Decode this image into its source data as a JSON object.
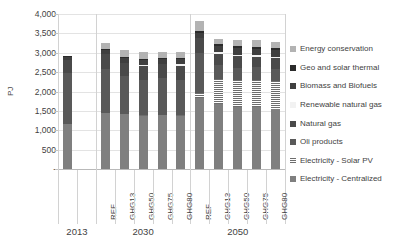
{
  "chart_data": {
    "type": "bar",
    "subtype": "stacked",
    "title": "",
    "xlabel": "",
    "ylabel": "PJ",
    "ylim": [
      0,
      4000
    ],
    "ytick_step": 500,
    "grid": true,
    "legend_position": "right",
    "ytick_labels": [
      "-",
      "500",
      "1,000",
      "1,500",
      "2,000",
      "2,500",
      "3,000",
      "3,500",
      "4,000"
    ],
    "ytick_values": [
      0,
      500,
      1000,
      1500,
      2000,
      2500,
      3000,
      3500,
      4000
    ],
    "groups": [
      {
        "label": "2013",
        "categories": [
          "",
          ""
        ]
      },
      {
        "label": "2030",
        "categories": [
          "REF",
          "GHG13",
          "GHG50",
          "GHG75",
          "GHG80"
        ]
      },
      {
        "label": "2050",
        "categories": [
          "REF",
          "GHG13",
          "GHG50",
          "GHG75",
          "GHG80"
        ]
      }
    ],
    "x": [
      "2013",
      "",
      "2030 REF",
      "2030 GHG13",
      "2030 GHG50",
      "2030 GHG75",
      "2030 GHG80",
      "2050 REF",
      "2050 GHG13",
      "2050 GHG50",
      "2050 GHG75",
      "2050 GHG80"
    ],
    "series": [
      {
        "name": "Electricity - Centralized",
        "color": "#7f7f7f",
        "pattern": "solid",
        "values": [
          1150,
          null,
          1440,
          1420,
          1370,
          1390,
          1370,
          1830,
          1680,
          1610,
          1600,
          1560
        ]
      },
      {
        "name": "Electricity - Solar PV",
        "color": "#6d6d6d",
        "pattern": "hatched",
        "values": [
          0,
          null,
          0,
          0,
          30,
          0,
          30,
          120,
          650,
          680,
          700,
          700
        ]
      },
      {
        "name": "Oli products",
        "color": "#595959",
        "pattern": "solid",
        "values": [
          1330,
          null,
          1130,
          990,
          910,
          960,
          910,
          1040,
          350,
          330,
          320,
          320
        ]
      },
      {
        "name": "Natural gas",
        "color": "#4a4a4a",
        "pattern": "solid",
        "values": [
          340,
          null,
          400,
          330,
          340,
          350,
          350,
          390,
          300,
          290,
          280,
          280
        ]
      },
      {
        "name": "Renewable natural gas",
        "color": "#f2f2f2",
        "pattern": "solid",
        "values": [
          0,
          null,
          0,
          0,
          40,
          0,
          40,
          0,
          30,
          40,
          40,
          40
        ]
      },
      {
        "name": "Biomass and Biofuels",
        "color": "#3f3f3f",
        "pattern": "solid",
        "values": [
          80,
          null,
          110,
          130,
          130,
          130,
          130,
          130,
          160,
          170,
          170,
          170
        ]
      },
      {
        "name": "Geo and solar thermal",
        "color": "#2b2b2b",
        "pattern": "solid",
        "values": [
          20,
          null,
          30,
          30,
          30,
          30,
          30,
          40,
          50,
          50,
          50,
          50
        ]
      },
      {
        "name": "Energy conservation",
        "color": "#b3b3b3",
        "pattern": "solid",
        "values": [
          0,
          null,
          140,
          160,
          160,
          170,
          160,
          260,
          140,
          170,
          170,
          170
        ]
      }
    ],
    "totals": [
      2920,
      null,
      3250,
      3060,
      3010,
      3030,
      3020,
      3810,
      3360,
      3340,
      3330,
      3290
    ]
  }
}
